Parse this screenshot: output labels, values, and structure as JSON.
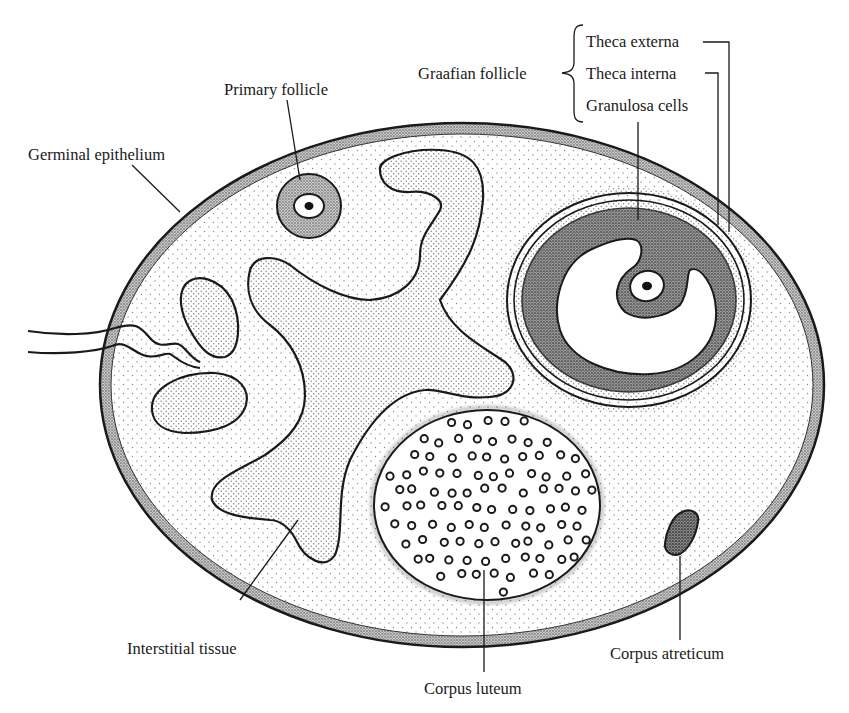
{
  "figure": {
    "labels": {
      "primary_follicle": "Primary follicle",
      "germinal_epithelium": "Germinal epithelium",
      "graafian_follicle": "Graafian follicle",
      "theca_externa": "Theca externa",
      "theca_interna": "Theca interna",
      "granulosa_cells": "Granulosa cells",
      "interstitial_tissue": "Interstitial tissue",
      "corpus_luteum": "Corpus luteum",
      "corpus_atreticum": "Corpus atreticum"
    },
    "colors": {
      "ink": "#1a1a1a",
      "background": "#ffffff",
      "stroma_stipple": "#8a8a8a",
      "dense_stipple": "#555555"
    }
  }
}
